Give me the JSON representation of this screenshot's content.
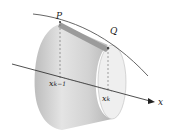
{
  "diagram": {
    "type": "surface-of-revolution-frustum",
    "labels": {
      "P": "P",
      "Q": "Q",
      "x_left_base": "x",
      "x_left_sub": "k−1",
      "x_right_base": "x",
      "x_right_sub": "k",
      "axis": "x"
    },
    "colors": {
      "surface_light": "#e6e6e6",
      "surface_mid": "#cfcfcf",
      "surface_dark": "#a9a9a9",
      "band": "#9a9a9a",
      "curve": "#555555",
      "axis": "#222222",
      "dashed": "#666666"
    }
  }
}
